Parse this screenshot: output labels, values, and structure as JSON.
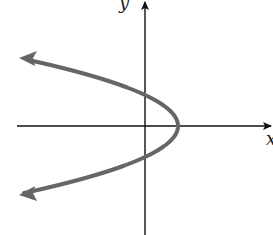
{
  "chart_data": {
    "type": "line",
    "title": "",
    "xlabel": "x",
    "ylabel": "y",
    "grid": false,
    "legend": null,
    "curve": {
      "shape": "parabola",
      "opens": "left",
      "equation_form": "x = h - a*y^2",
      "vertex": [
        1,
        0
      ],
      "y_intercepts": [
        1,
        -1
      ],
      "ends_with_arrows": true,
      "color": "#666666"
    },
    "axes": {
      "color": "#111111",
      "x_axis_arrow": "right",
      "y_axis_arrow": "up",
      "tick_labels": []
    }
  },
  "labels": {
    "x_axis": "x",
    "y_axis": "y"
  },
  "colors": {
    "curve": "#666666",
    "axes": "#111111",
    "background": "#ffffff"
  }
}
